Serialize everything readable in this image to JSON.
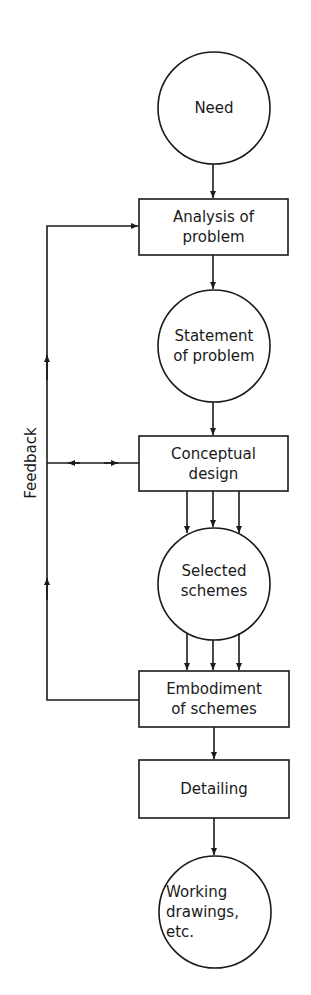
{
  "diagram": {
    "type": "flowchart",
    "nodes": [
      {
        "id": "need",
        "shape": "circle",
        "label": "Need"
      },
      {
        "id": "analysis",
        "shape": "box",
        "label": "Analysis of\nproblem"
      },
      {
        "id": "statement",
        "shape": "circle",
        "label": "Statement\nof problem"
      },
      {
        "id": "conceptual",
        "shape": "box",
        "label": "Conceptual\ndesign"
      },
      {
        "id": "selected",
        "shape": "circle",
        "label": "Selected\nschemes"
      },
      {
        "id": "embodiment",
        "shape": "box",
        "label": "Embodiment\nof schemes"
      },
      {
        "id": "detailing",
        "shape": "box",
        "label": "Detailing"
      },
      {
        "id": "working",
        "shape": "circle",
        "label": "Working\ndrawings,\netc."
      }
    ],
    "feedback_label": "Feedback",
    "edges": [
      {
        "from": "need",
        "to": "analysis"
      },
      {
        "from": "analysis",
        "to": "statement"
      },
      {
        "from": "statement",
        "to": "conceptual"
      },
      {
        "from": "conceptual",
        "to": "selected",
        "count": 3
      },
      {
        "from": "selected",
        "to": "embodiment",
        "count": 3
      },
      {
        "from": "embodiment",
        "to": "detailing"
      },
      {
        "from": "detailing",
        "to": "working"
      },
      {
        "from": "embodiment",
        "to": "analysis",
        "label": "Feedback"
      },
      {
        "from": "conceptual",
        "to": "feedback-loop",
        "bidirectional": true
      }
    ]
  }
}
